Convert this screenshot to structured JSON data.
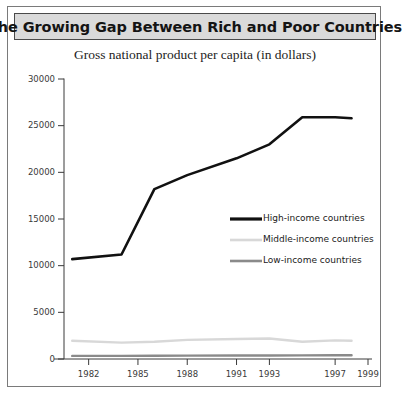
{
  "figure": {
    "title": "The Growing Gap Between Rich and Poor Countries",
    "subtitle": "Gross national product per capita (in dollars)"
  },
  "colors": {
    "title_band": "#dadada",
    "frame": "#7a7a7a",
    "axis": "#3a3a3a",
    "high_income": "#111111",
    "middle_income": "#d8d8d8",
    "low_income": "#8a8a8a"
  },
  "chart_data": {
    "type": "line",
    "title": "The Growing Gap Between Rich and Poor Countries",
    "subtitle": "Gross national product per capita (in dollars)",
    "xlabel": "",
    "ylabel": "",
    "xlim": [
      1980.5,
      1999
    ],
    "ylim": [
      0,
      30000
    ],
    "grid": false,
    "legend_position": "inside-right",
    "ytick_labels": [
      "0",
      "5000",
      "10000",
      "15000",
      "20000",
      "25000",
      "30000"
    ],
    "yticks": [
      0,
      5000,
      10000,
      15000,
      20000,
      25000,
      30000
    ],
    "xtick_labels": [
      "1982",
      "1985",
      "1988",
      "1991",
      "1993",
      "1997",
      "1999"
    ],
    "xticks": [
      1982,
      1985,
      1988,
      1991,
      1993,
      1997,
      1999
    ],
    "x": [
      1981,
      1984,
      1986,
      1988,
      1991,
      1993,
      1995,
      1997,
      1998
    ],
    "series": [
      {
        "name": "High-income countries",
        "color": "#111111",
        "values": [
          10700,
          11200,
          18200,
          19700,
          21500,
          23000,
          25900,
          25900,
          25800
        ]
      },
      {
        "name": "Middle-income countries",
        "color": "#d8d8d8",
        "values": [
          1950,
          1750,
          1850,
          2050,
          2150,
          2200,
          1850,
          2000,
          1950
        ]
      },
      {
        "name": "Low-income countries",
        "color": "#8a8a8a",
        "values": [
          330,
          340,
          350,
          360,
          370,
          380,
          390,
          400,
          400
        ]
      }
    ]
  },
  "legend": {
    "items": [
      {
        "label": "High-income countries"
      },
      {
        "label": "Middle-income countries"
      },
      {
        "label": "Low-income countries"
      }
    ]
  }
}
